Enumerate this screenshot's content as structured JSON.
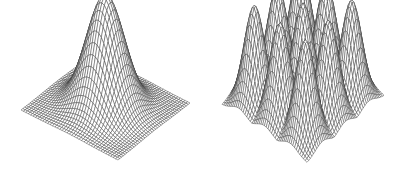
{
  "figure": {
    "line_color": "#3a3a3a",
    "background": "#ffffff",
    "panels": [
      {
        "id": "left",
        "label": "Single Gaussian peak surface",
        "function": "gaussian_single",
        "grid": 40,
        "sigma": 0.16,
        "peaks": [
          [
            0.5,
            0.5
          ]
        ],
        "corners": {
          "front_left": [
            21,
            110
          ],
          "front_right": [
            118,
            160
          ],
          "back_right": [
            190,
            103
          ],
          "back_left": [
            93,
            54
          ]
        },
        "height_px": 112
      },
      {
        "id": "right",
        "label": "Nine Gaussian peaks surface (3x3 grid)",
        "function": "gaussian_3x3",
        "grid": 48,
        "sigma": 0.09,
        "peaks": [
          [
            0.2,
            0.2
          ],
          [
            0.5,
            0.2
          ],
          [
            0.8,
            0.2
          ],
          [
            0.2,
            0.5
          ],
          [
            0.5,
            0.5
          ],
          [
            0.8,
            0.5
          ],
          [
            0.2,
            0.8
          ],
          [
            0.5,
            0.8
          ],
          [
            0.8,
            0.8
          ]
        ],
        "corners": {
          "front_left": [
            19,
            105
          ],
          "front_right": [
            104,
            163
          ],
          "back_right": [
            181,
            96
          ],
          "back_left": [
            96,
            40
          ]
        },
        "height_px": 98
      }
    ]
  }
}
